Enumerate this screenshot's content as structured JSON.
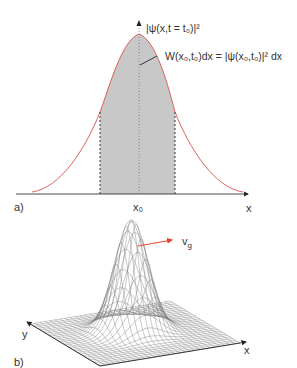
{
  "panel_a": {
    "label": "a)",
    "y_axis_label": "|ψ(x,t = t₀)|²",
    "annotation": "W(x₀,t₀)dx = |ψ(x₀,t₀)|² dx",
    "x_tick": "x₀",
    "x_axis_label": "x"
  },
  "panel_b": {
    "label": "b)",
    "velocity_label": "v",
    "velocity_sub": "g",
    "x_axis_label": "x",
    "y_axis_label": "y"
  },
  "colors": {
    "curve": "#d9534f",
    "shade": "#c8c8c8",
    "axis": "#333333",
    "arrow": "#e8452c"
  }
}
